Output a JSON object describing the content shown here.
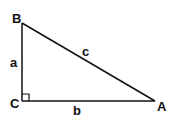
{
  "diagram": {
    "type": "right-triangle",
    "colors": {
      "stroke": "#111111",
      "background": "#ffffff"
    },
    "vertices": [
      {
        "id": "B",
        "label": "B",
        "x": 22,
        "y": 23
      },
      {
        "id": "C",
        "label": "C",
        "x": 22,
        "y": 101
      },
      {
        "id": "A",
        "label": "A",
        "x": 155,
        "y": 101
      }
    ],
    "sides": [
      {
        "id": "a",
        "label": "a",
        "from": "B",
        "to": "C"
      },
      {
        "id": "b",
        "label": "b",
        "from": "C",
        "to": "A"
      },
      {
        "id": "c",
        "label": "c",
        "from": "B",
        "to": "A"
      }
    ],
    "right_angle_at": "C",
    "labels": {
      "vertex_B": "B",
      "vertex_C": "C",
      "vertex_A": "A",
      "side_a": "a",
      "side_b": "b",
      "side_c": "c"
    }
  }
}
